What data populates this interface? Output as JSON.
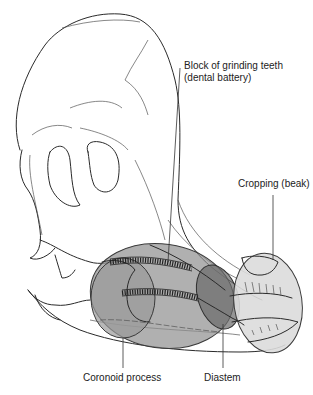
{
  "diagram": {
    "labels": {
      "dental_battery_line1": "Block of grinding teeth",
      "dental_battery_line2": "(dental battery)",
      "cropping": "Cropping (beak)",
      "coronoid": "Coronoid process",
      "diastem": "Diastem"
    },
    "regions": [
      {
        "name": "dental-battery",
        "color": "#9a9a9a",
        "opacity": 0.75
      },
      {
        "name": "coronoid-process",
        "color": "#8a8a8a",
        "opacity": 0.7
      },
      {
        "name": "diastem",
        "color": "#6f6f6f",
        "opacity": 0.75
      },
      {
        "name": "beak",
        "color": "#d8d8d8",
        "opacity": 0.85
      }
    ]
  }
}
